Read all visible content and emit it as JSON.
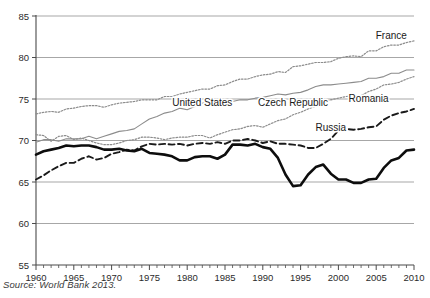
{
  "figure": {
    "source_note": "Source: World Bank 2013."
  },
  "chart_data": {
    "type": "line",
    "title": "",
    "xlabel": "",
    "ylabel": "",
    "xlim": [
      1960,
      2010
    ],
    "ylim": [
      55,
      85
    ],
    "yticks": [
      55,
      60,
      65,
      70,
      75,
      80,
      85
    ],
    "xticks": [
      1960,
      1965,
      1970,
      1975,
      1980,
      1985,
      1990,
      1995,
      2000,
      2005,
      2010
    ],
    "xminor_step": 1,
    "grid": "horizontal",
    "legend": "inline-labels",
    "x": [
      1960,
      1961,
      1962,
      1963,
      1964,
      1965,
      1966,
      1967,
      1968,
      1969,
      1970,
      1971,
      1972,
      1973,
      1974,
      1975,
      1976,
      1977,
      1978,
      1979,
      1980,
      1981,
      1982,
      1983,
      1984,
      1985,
      1986,
      1987,
      1988,
      1989,
      1990,
      1991,
      1992,
      1993,
      1994,
      1995,
      1996,
      1997,
      1998,
      1999,
      2000,
      2001,
      2002,
      2003,
      2004,
      2005,
      2006,
      2007,
      2008,
      2009,
      2010
    ],
    "series": [
      {
        "name": "France",
        "style": "dotted",
        "color": "#8c8c8c",
        "label_x": 2007,
        "label_y": 82.2,
        "values": [
          73.2,
          73.4,
          73.5,
          73.4,
          73.8,
          73.9,
          74.1,
          74.2,
          74.2,
          74.0,
          74.3,
          74.5,
          74.6,
          74.7,
          74.9,
          74.9,
          74.9,
          75.3,
          75.3,
          75.6,
          75.8,
          76.0,
          76.2,
          76.2,
          76.6,
          76.7,
          77.1,
          77.4,
          77.4,
          77.7,
          77.9,
          78.0,
          78.3,
          78.2,
          78.9,
          79.0,
          79.2,
          79.4,
          79.4,
          79.5,
          79.9,
          80.1,
          80.2,
          80.1,
          80.8,
          80.8,
          81.3,
          81.5,
          81.5,
          81.8,
          82.0
        ]
      },
      {
        "name": "United States",
        "style": "solid-thin",
        "color": "#8c8c8c",
        "label_x": 1982,
        "label_y": 74.2,
        "values": [
          69.8,
          70.1,
          70.1,
          69.9,
          70.2,
          70.2,
          70.2,
          70.5,
          70.2,
          70.5,
          70.8,
          71.1,
          71.2,
          71.4,
          72.0,
          72.6,
          72.9,
          73.3,
          73.5,
          73.9,
          73.7,
          74.1,
          74.5,
          74.6,
          74.7,
          74.7,
          74.7,
          74.9,
          74.9,
          75.1,
          75.2,
          75.4,
          75.6,
          75.5,
          75.7,
          75.8,
          76.1,
          76.5,
          76.7,
          76.7,
          76.8,
          76.9,
          77.0,
          77.1,
          77.5,
          77.5,
          77.7,
          78.1,
          78.1,
          78.5,
          78.5
        ]
      },
      {
        "name": "Czech Republic",
        "style": "dotted",
        "color": "#8c8c8c",
        "label_x": 1994,
        "label_y": 74.1,
        "values": [
          70.7,
          70.6,
          69.9,
          70.5,
          70.6,
          70.1,
          70.3,
          70.0,
          69.7,
          69.5,
          69.5,
          69.7,
          70.0,
          70.1,
          70.4,
          70.4,
          70.3,
          70.1,
          70.3,
          70.4,
          70.4,
          70.6,
          70.6,
          70.3,
          70.7,
          71.0,
          71.3,
          71.4,
          71.7,
          71.8,
          71.6,
          72.0,
          72.4,
          72.6,
          73.1,
          73.4,
          73.8,
          74.1,
          74.7,
          74.9,
          75.1,
          75.3,
          75.4,
          75.4,
          75.9,
          76.2,
          76.7,
          76.8,
          77.0,
          77.4,
          77.7
        ]
      },
      {
        "name": "Romania",
        "style": "dashed",
        "color": "#1a1a1a",
        "label_x": 2004,
        "label_y": 74.6,
        "values": [
          65.3,
          65.8,
          66.4,
          66.9,
          67.3,
          67.3,
          67.8,
          68.1,
          67.7,
          67.9,
          68.4,
          68.6,
          68.9,
          68.8,
          69.3,
          69.6,
          69.5,
          69.6,
          69.5,
          69.6,
          69.4,
          69.6,
          69.7,
          69.6,
          69.8,
          69.6,
          70.0,
          70.0,
          70.2,
          70.0,
          69.7,
          69.9,
          69.6,
          69.6,
          69.5,
          69.4,
          69.1,
          69.1,
          69.6,
          70.2,
          71.2,
          71.4,
          71.3,
          71.4,
          71.6,
          71.7,
          72.5,
          73.0,
          73.3,
          73.5,
          73.8
        ]
      },
      {
        "name": "Russia",
        "style": "solid-thick",
        "color": "#0d0d0d",
        "label_x": 1999,
        "label_y": 71.1,
        "values": [
          68.3,
          68.7,
          68.9,
          69.1,
          69.4,
          69.3,
          69.4,
          69.4,
          69.2,
          68.9,
          68.9,
          69.0,
          68.8,
          68.7,
          69.0,
          68.5,
          68.4,
          68.3,
          68.1,
          67.6,
          67.6,
          68.0,
          68.1,
          68.1,
          67.8,
          68.3,
          69.5,
          69.5,
          69.4,
          69.6,
          69.2,
          69.0,
          67.9,
          65.9,
          64.5,
          64.6,
          65.9,
          66.8,
          67.1,
          66.0,
          65.3,
          65.3,
          64.9,
          64.9,
          65.3,
          65.4,
          66.7,
          67.6,
          67.9,
          68.8,
          68.9
        ]
      }
    ]
  }
}
